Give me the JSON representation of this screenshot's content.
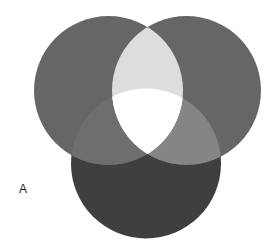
{
  "panel_label": "A",
  "diagram": {
    "type": "venn",
    "sets": [
      {
        "id": "left",
        "cx": 108.5,
        "cy": 90.5,
        "r": 74.5,
        "fill": "#666666"
      },
      {
        "id": "right",
        "cx": 186.5,
        "cy": 90.5,
        "r": 74.5,
        "fill": "#666666"
      },
      {
        "id": "bottom",
        "cx": 146,
        "cy": 163.5,
        "r": 75,
        "fill": "#3f3f3f"
      }
    ],
    "regions": {
      "left_right": "#dddddd",
      "left_bottom": "#6e6e6e",
      "right_bottom": "#858585",
      "all": "#ffffff"
    }
  }
}
